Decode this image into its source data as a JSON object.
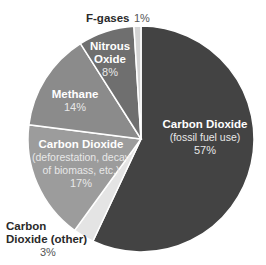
{
  "chart_data": {
    "type": "pie",
    "title": "",
    "start_angle_deg": 0,
    "direction": "clockwise",
    "center": [
      141,
      139
    ],
    "radius": 113,
    "slices": [
      {
        "key": "fossil",
        "label": "Carbon Dioxide",
        "sublabel": "(fossil fuel use)",
        "value": 57,
        "pct_label": "57%",
        "color": "#434343"
      },
      {
        "key": "other",
        "label": "Carbon Dioxide (other)",
        "sublabel": "",
        "value": 3,
        "pct_label": "3%",
        "color": "#e4e4e4"
      },
      {
        "key": "deforest",
        "label": "Carbon Dioxide",
        "sublabel": "(deforestation, decay of biomass, etc.)",
        "value": 17,
        "pct_label": "17%",
        "color": "#9c9c9c"
      },
      {
        "key": "methane",
        "label": "Methane",
        "sublabel": "",
        "value": 14,
        "pct_label": "14%",
        "color": "#8b8b8b"
      },
      {
        "key": "nitrous",
        "label": "Nitrous Oxide",
        "sublabel": "",
        "value": 8,
        "pct_label": "8%",
        "color": "#6f6f6f"
      },
      {
        "key": "fgases",
        "label": "F-gases",
        "sublabel": "",
        "value": 1,
        "pct_label": "1%",
        "color": "#d4d4d4"
      }
    ],
    "legend": "none (direct labels)"
  },
  "labels": {
    "fossil": {
      "title": "Carbon Dioxide",
      "sub": "(fossil fuel use)",
      "pct": "57%"
    },
    "other": {
      "title1": "Carbon",
      "title2": "Dioxide (other)",
      "pct": "3%"
    },
    "deforest": {
      "title": "Carbon Dioxide",
      "sub1": "(deforestation, decay",
      "sub2": "of biomass, etc.)",
      "pct": "17%"
    },
    "methane": {
      "title": "Methane",
      "pct": "14%"
    },
    "nitrous": {
      "title1": "Nitrous",
      "title2": "Oxide",
      "pct": "8%"
    },
    "fgases": {
      "title": "F-gases",
      "pct": "1%"
    }
  }
}
